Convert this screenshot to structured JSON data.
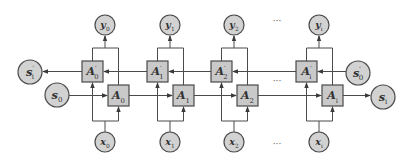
{
  "colors": {
    "stroke": "#4a4a4a",
    "box_fill": "#c9c9c9",
    "node_fill": "#d2d2d2",
    "text": "#333333"
  },
  "columns": [
    {
      "id": "0",
      "cx": 105,
      "output": {
        "base": "y",
        "sub": "0"
      },
      "input": {
        "base": "x",
        "sub": "0"
      },
      "backward_cell": {
        "base": "A",
        "sub": "0",
        "sup": "′"
      },
      "forward_cell": {
        "base": "A",
        "sub": "0"
      }
    },
    {
      "id": "1",
      "cx": 170,
      "output": {
        "base": "y",
        "sub": "1"
      },
      "input": {
        "base": "x",
        "sub": "1"
      },
      "backward_cell": {
        "base": "A",
        "sub": "1",
        "sup": "′"
      },
      "forward_cell": {
        "base": "A",
        "sub": "1"
      }
    },
    {
      "id": "2",
      "cx": 234,
      "output": {
        "base": "y",
        "sub": "2"
      },
      "input": {
        "base": "x",
        "sub": "2"
      },
      "backward_cell": {
        "base": "A",
        "sub": "2",
        "sup": "′"
      },
      "forward_cell": {
        "base": "A",
        "sub": "2"
      }
    },
    {
      "id": "i",
      "cx": 319,
      "output": {
        "base": "y",
        "sub": "i"
      },
      "input": {
        "base": "x",
        "sub": "i"
      },
      "backward_cell": {
        "base": "A",
        "sub": "i",
        "sup": "′"
      },
      "forward_cell": {
        "base": "A",
        "sub": "i"
      }
    }
  ],
  "states": {
    "backward_final": {
      "base": "s",
      "sub": "i",
      "sup": "′"
    },
    "forward_initial": {
      "base": "s",
      "sub": "0"
    },
    "backward_initial": {
      "base": "s",
      "sub": "0",
      "sup": "′"
    },
    "forward_final": {
      "base": "s",
      "sub": "i"
    }
  },
  "ellipsis": "···"
}
